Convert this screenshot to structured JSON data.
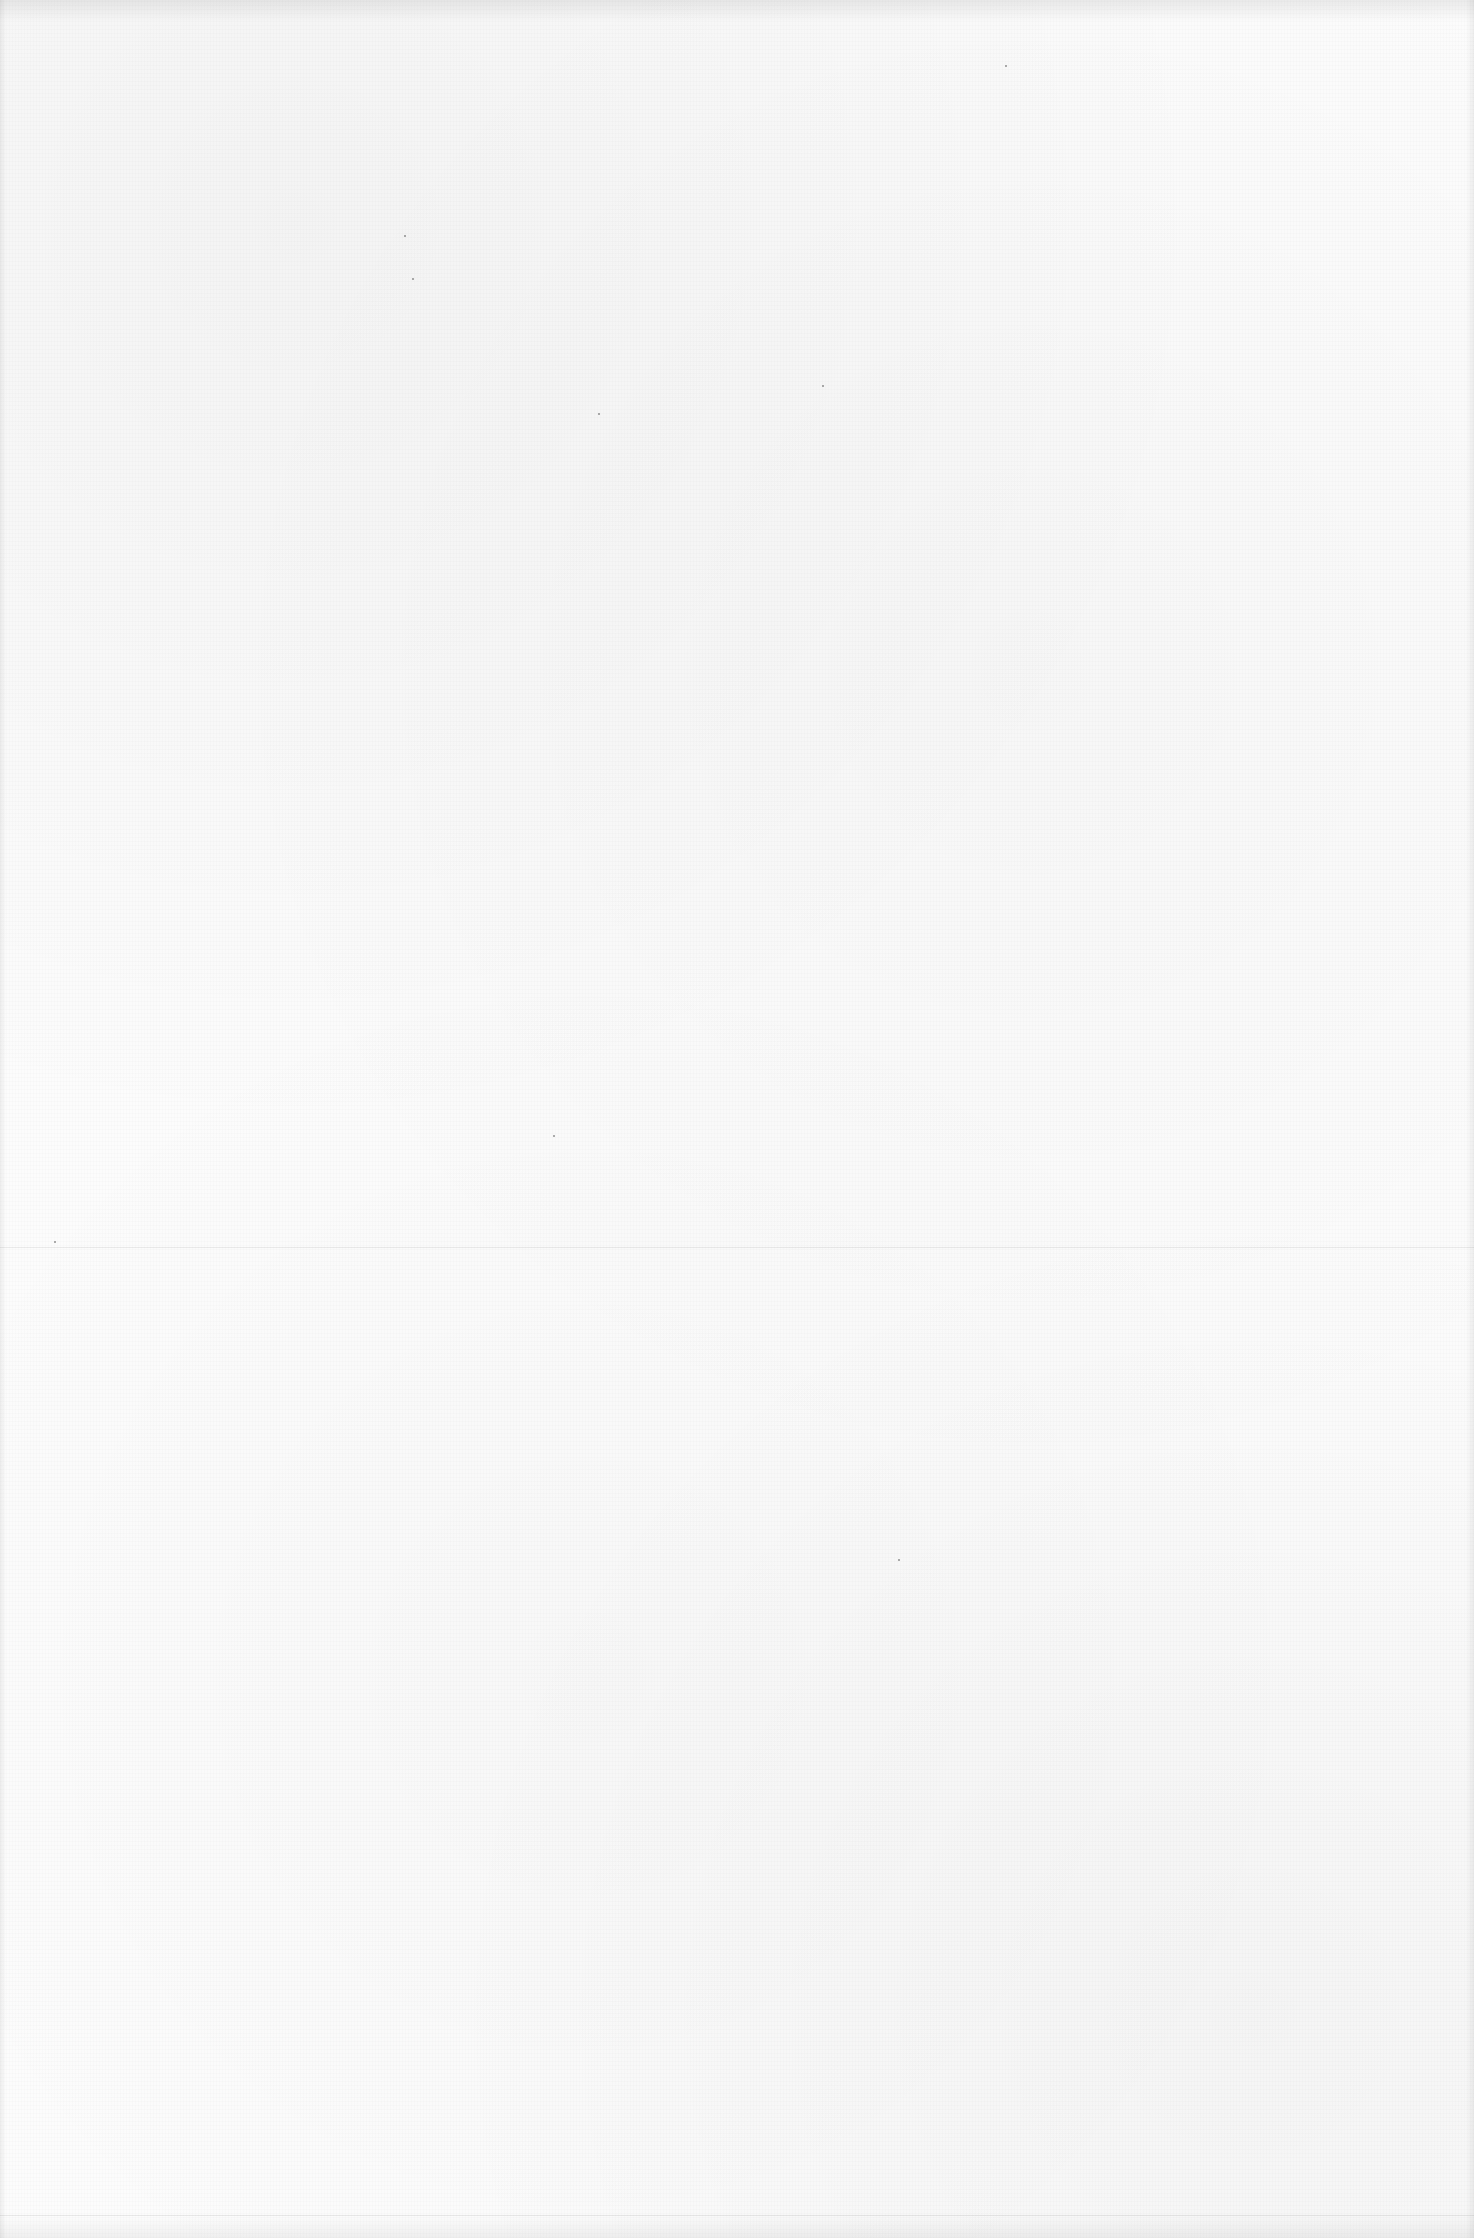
{
  "document": {
    "type": "blank-scanned-page",
    "text_content": "",
    "background_color": "#fcfcfc",
    "fold_line_y": 1247,
    "bottom_line_y": 2215,
    "specks": [
      {
        "x": 412,
        "y": 278
      },
      {
        "x": 404,
        "y": 235
      },
      {
        "x": 1005,
        "y": 65
      },
      {
        "x": 822,
        "y": 385
      },
      {
        "x": 553,
        "y": 1135
      },
      {
        "x": 54,
        "y": 1241
      },
      {
        "x": 898,
        "y": 1559
      },
      {
        "x": 598,
        "y": 413
      }
    ]
  }
}
